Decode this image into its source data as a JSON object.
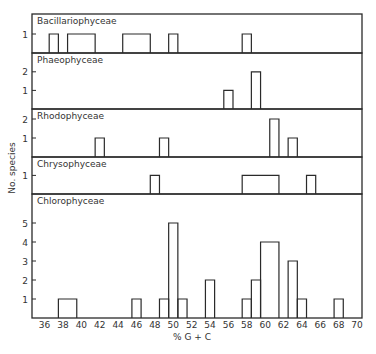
{
  "chart_data": {
    "type": "bar",
    "subtype": "stacked-panel histogram",
    "title": "",
    "xlabel": "% G + C",
    "ylabel": "No. species",
    "xlim": [
      34.6,
      70.5
    ],
    "x_ticks": [
      36,
      38,
      40,
      42,
      44,
      46,
      48,
      50,
      52,
      54,
      56,
      58,
      60,
      62,
      64,
      66,
      68,
      70
    ],
    "bin_width": 1,
    "grid": false,
    "legend": null,
    "panels": [
      {
        "name": "Bacillariophyceae",
        "y_ticks": [
          1
        ],
        "ylim": [
          0,
          1.9
        ],
        "bins": [
          {
            "x0": 36.5,
            "x1": 37.5,
            "count": 1
          },
          {
            "x0": 38.5,
            "x1": 41.5,
            "count": 1
          },
          {
            "x0": 44.5,
            "x1": 47.5,
            "count": 1
          },
          {
            "x0": 49.5,
            "x1": 50.5,
            "count": 1
          },
          {
            "x0": 57.5,
            "x1": 58.5,
            "count": 1
          }
        ]
      },
      {
        "name": "Phaeophyceae",
        "y_ticks": [
          1,
          2
        ],
        "ylim": [
          0,
          2.8
        ],
        "bins": [
          {
            "x0": 55.5,
            "x1": 56.5,
            "count": 1
          },
          {
            "x0": 58.5,
            "x1": 59.5,
            "count": 2
          }
        ]
      },
      {
        "name": "Rhodophyceae",
        "y_ticks": [
          1,
          2
        ],
        "ylim": [
          0,
          2.5
        ],
        "bins": [
          {
            "x0": 41.5,
            "x1": 42.5,
            "count": 1
          },
          {
            "x0": 48.5,
            "x1": 49.5,
            "count": 1
          },
          {
            "x0": 60.5,
            "x1": 61.5,
            "count": 2
          },
          {
            "x0": 62.5,
            "x1": 63.5,
            "count": 1
          }
        ]
      },
      {
        "name": "Chrysophyceae",
        "y_ticks": [
          1
        ],
        "ylim": [
          0,
          1.9
        ],
        "bins": [
          {
            "x0": 47.5,
            "x1": 48.5,
            "count": 1
          },
          {
            "x0": 57.5,
            "x1": 61.5,
            "count": 1
          },
          {
            "x0": 64.5,
            "x1": 65.5,
            "count": 1
          }
        ]
      },
      {
        "name": "Chlorophyceae",
        "y_ticks": [
          1,
          2,
          3,
          4,
          5
        ],
        "ylim": [
          0,
          6.5
        ],
        "bins": [
          {
            "x0": 37.5,
            "x1": 39.5,
            "count": 1
          },
          {
            "x0": 45.5,
            "x1": 46.5,
            "count": 1
          },
          {
            "x0": 48.5,
            "x1": 49.5,
            "count": 1
          },
          {
            "x0": 49.5,
            "x1": 50.5,
            "count": 5
          },
          {
            "x0": 50.5,
            "x1": 51.5,
            "count": 1
          },
          {
            "x0": 53.5,
            "x1": 54.5,
            "count": 2
          },
          {
            "x0": 57.5,
            "x1": 58.5,
            "count": 1
          },
          {
            "x0": 58.5,
            "x1": 59.5,
            "count": 2
          },
          {
            "x0": 59.5,
            "x1": 61.5,
            "count": 4
          },
          {
            "x0": 62.5,
            "x1": 63.5,
            "count": 3
          },
          {
            "x0": 63.5,
            "x1": 64.5,
            "count": 1
          },
          {
            "x0": 67.5,
            "x1": 68.5,
            "count": 1
          }
        ]
      }
    ]
  },
  "layout": {
    "frame_left": 32,
    "frame_right": 362,
    "x0_value": 36,
    "x0_px": 44.6,
    "px_per_unit": 9.19,
    "panel_px": [
      {
        "top": 14,
        "bottom": 53,
        "px_per_count": 19
      },
      {
        "top": 53,
        "bottom": 109,
        "px_per_count": 18.6
      },
      {
        "top": 109,
        "bottom": 157,
        "px_per_count": 19
      },
      {
        "top": 157,
        "bottom": 194,
        "px_per_count": 18.6
      },
      {
        "top": 194,
        "bottom": 318,
        "px_per_count": 19
      }
    ]
  }
}
